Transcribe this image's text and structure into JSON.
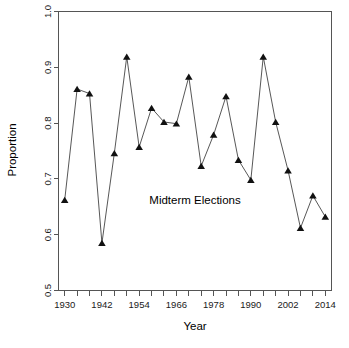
{
  "chart_data": {
    "type": "line",
    "title": "",
    "subtitle": "",
    "xlabel": "Year",
    "ylabel": "Proportion",
    "xlim": [
      1928,
      2016
    ],
    "ylim": [
      0.5,
      1.0
    ],
    "grid": false,
    "legend": "none",
    "annotations": [
      {
        "text": "Midterm Elections",
        "x": 1972,
        "y": 0.655
      }
    ],
    "x_tick_labels": [
      "1930",
      "1942",
      "1954",
      "1966",
      "1978",
      "1990",
      "2002",
      "2014"
    ],
    "x_tick_values": [
      1930,
      1942,
      1954,
      1966,
      1978,
      1990,
      2002,
      2014
    ],
    "x_minor_tick_values": [
      1930,
      1934,
      1938,
      1942,
      1946,
      1950,
      1954,
      1958,
      1962,
      1966,
      1970,
      1974,
      1978,
      1982,
      1986,
      1990,
      1994,
      1998,
      2002,
      2006,
      2010,
      2014
    ],
    "y_tick_labels": [
      "0.5",
      "0.6",
      "0.7",
      "0.8",
      "0.9",
      "1.0"
    ],
    "y_tick_values": [
      0.5,
      0.6,
      0.7,
      0.8,
      0.9,
      1.0
    ],
    "marker": "filled-triangle",
    "line_color": "#444444",
    "marker_color": "#111111",
    "x": [
      1930,
      1934,
      1938,
      1942,
      1946,
      1950,
      1954,
      1958,
      1962,
      1966,
      1970,
      1974,
      1978,
      1982,
      1986,
      1990,
      1994,
      1998,
      2002,
      2006,
      2010,
      2014
    ],
    "values": [
      0.662,
      0.861,
      0.853,
      0.585,
      0.746,
      0.919,
      0.757,
      0.827,
      0.802,
      0.799,
      0.883,
      0.723,
      0.779,
      0.848,
      0.734,
      0.698,
      0.919,
      0.802,
      0.715,
      0.612,
      0.67,
      0.632
    ],
    "series": [
      {
        "name": "Proportion",
        "values": [
          0.662,
          0.861,
          0.853,
          0.585,
          0.746,
          0.919,
          0.757,
          0.827,
          0.802,
          0.799,
          0.883,
          0.723,
          0.779,
          0.848,
          0.734,
          0.698,
          0.919,
          0.802,
          0.715,
          0.612,
          0.67,
          0.632
        ]
      }
    ]
  }
}
